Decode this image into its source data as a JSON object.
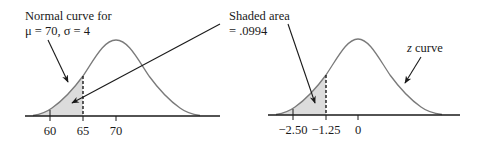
{
  "left_panel": {
    "label_line1": "Normal curve for",
    "label_line2": "μ = 70, σ = 4",
    "mean": 70,
    "sd": 4,
    "ticks": [
      "60",
      "65",
      "70"
    ],
    "cutoff": "65"
  },
  "right_panel": {
    "shaded_label_line1": "Shaded area",
    "shaded_label_line2": "= .0994",
    "curve_label_italic": "z",
    "curve_label_rest": " curve",
    "ticks": [
      "−2.50",
      "−1.25",
      "0"
    ],
    "cutoff": "−1.25"
  },
  "colors": {
    "curve": "#7a7a7a",
    "shade": "#dcdcdc",
    "axis": "#1a1a1a",
    "text": "#1a1a1a"
  }
}
